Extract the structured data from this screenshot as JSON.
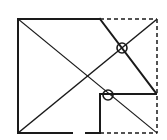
{
  "diagram": {
    "title": "Geometric construction: square with diagonals and marked intersections",
    "stroke_color": "#1a1a1a",
    "background": "#ffffff",
    "outer_square": {
      "x1": 18,
      "y1": 19,
      "x2": 157,
      "y2": 133
    },
    "solid_segments": [
      {
        "name": "top-edge-solid",
        "x1": 18,
        "y1": 19,
        "x2": 100,
        "y2": 19,
        "width": 2
      },
      {
        "name": "left-edge",
        "x1": 18,
        "y1": 19,
        "x2": 18,
        "y2": 133,
        "width": 2
      },
      {
        "name": "bottom-edge-solid-a",
        "x1": 18,
        "y1": 133,
        "x2": 72,
        "y2": 133,
        "width": 2
      },
      {
        "name": "bottom-edge-solid-b",
        "x1": 86,
        "y1": 133,
        "x2": 100,
        "y2": 133,
        "width": 2
      },
      {
        "name": "notch-vertical",
        "x1": 100,
        "y1": 133,
        "x2": 100,
        "y2": 94,
        "width": 2
      },
      {
        "name": "notch-horizontal",
        "x1": 100,
        "y1": 94,
        "x2": 156,
        "y2": 94,
        "width": 2
      },
      {
        "name": "fold-line",
        "x1": 100,
        "y1": 19,
        "x2": 156,
        "y2": 93,
        "width": 2
      },
      {
        "name": "diagonal-main",
        "x1": 18,
        "y1": 19,
        "x2": 157,
        "y2": 133,
        "width": 1.2
      },
      {
        "name": "diagonal-anti",
        "x1": 18,
        "y1": 133,
        "x2": 156,
        "y2": 20,
        "width": 1.5
      }
    ],
    "dashed_segments": [
      {
        "name": "top-edge-dashed",
        "x1": 100,
        "y1": 19,
        "x2": 157,
        "y2": 19
      },
      {
        "name": "right-edge-dashed",
        "x1": 157,
        "y1": 19,
        "x2": 157,
        "y2": 133
      },
      {
        "name": "bottom-edge-dashed",
        "x1": 100,
        "y1": 133,
        "x2": 157,
        "y2": 133
      }
    ],
    "markers": [
      {
        "name": "intersection-marker-upper",
        "cx": 122,
        "cy": 48,
        "r": 5
      },
      {
        "name": "intersection-marker-lower",
        "cx": 108,
        "cy": 95,
        "r": 5
      }
    ]
  }
}
